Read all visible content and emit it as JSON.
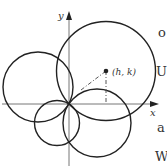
{
  "diagram": {
    "colors": {
      "stroke": "#222222",
      "axis": "#666666",
      "dashed": "#555555",
      "text": "#333333"
    },
    "axes": {
      "origin": {
        "x": 69,
        "y": 104
      },
      "x_label": "x",
      "y_label": "y"
    },
    "center_point": {
      "label": "(h, k)",
      "x": 106,
      "y": 71
    },
    "circles": [
      {
        "name": "large-circle",
        "cx": 106,
        "cy": 71,
        "r": 49.5
      },
      {
        "name": "left-circle",
        "cx": 38,
        "cy": 87,
        "r": 35
      },
      {
        "name": "small-lower-circle",
        "cx": 57,
        "cy": 123,
        "r": 22.5
      },
      {
        "name": "lower-right-circle",
        "cx": 97,
        "cy": 123,
        "r": 34
      }
    ]
  },
  "edge_text": [
    {
      "text": "o",
      "x": 158,
      "y": 26
    },
    {
      "text": "U",
      "x": 156,
      "y": 65
    },
    {
      "text": "a",
      "x": 157,
      "y": 121
    },
    {
      "text": "W",
      "x": 155,
      "y": 150
    }
  ]
}
